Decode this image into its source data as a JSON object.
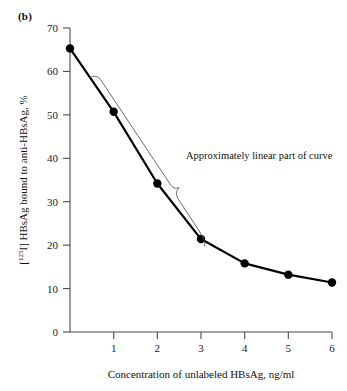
{
  "figure": {
    "panel_label": "(b)"
  },
  "chart_data": {
    "type": "line",
    "title": "",
    "panel": "(b)",
    "xlabel": "Concentration of unlabeled HBsAg, ng/ml",
    "ylabel": "[125I] HBsAg bound to anti-HBsAg, %",
    "ylabel_parts": {
      "prefix": "[",
      "superscript": "125",
      "suffix": "I] HBsAg bound to anti-HBsAg, %"
    },
    "x": [
      0,
      1,
      2,
      3,
      4,
      5,
      6
    ],
    "values": [
      65.3,
      50.7,
      34.2,
      21.4,
      15.8,
      13.2,
      11.4
    ],
    "series": [
      {
        "name": "[125I] HBsAg bound to anti-HBsAg",
        "values": [
          65.3,
          50.7,
          34.2,
          21.4,
          15.8,
          13.2,
          11.4
        ]
      }
    ],
    "xlim": [
      0,
      6.4
    ],
    "ylim": [
      0,
      70
    ],
    "xticks": [
      "1",
      "2",
      "3",
      "4",
      "5",
      "6"
    ],
    "xtick_values": [
      1,
      2,
      3,
      4,
      5,
      6
    ],
    "yticks": [
      "0",
      "10",
      "20",
      "30",
      "40",
      "50",
      "60",
      "70"
    ],
    "ytick_values": [
      0,
      10,
      20,
      30,
      40,
      50,
      60,
      70
    ],
    "grid": false,
    "legend": false,
    "marker": "filled-circle",
    "line_color": "#000000",
    "marker_color": "#000000",
    "axis_color": "#4a4a4a",
    "annotations": [
      {
        "text": "Approximately linear part of curve",
        "kind": "brace-label",
        "brace_color": "#5a5a5a",
        "spans_x": [
          0,
          3
        ]
      }
    ]
  }
}
